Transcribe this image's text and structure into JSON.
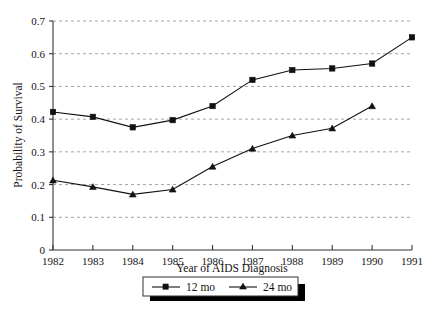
{
  "chart_data": {
    "type": "line",
    "title": "",
    "xlabel": "Year of AIDS Diagnosis",
    "ylabel": "Probability of Survival",
    "x": [
      1982,
      1983,
      1984,
      1985,
      1986,
      1987,
      1988,
      1989,
      1990,
      1991
    ],
    "xticklabels": [
      "1982",
      "1983",
      "1984",
      "1985",
      "1986",
      "1987",
      "1988",
      "1989",
      "1990",
      "1991"
    ],
    "yticklabels": [
      "0",
      "0.1",
      "0.2",
      "0.3",
      "0.4",
      "0.5",
      "0.6",
      "0.7"
    ],
    "yticks": [
      0,
      0.1,
      0.2,
      0.3,
      0.4,
      0.5,
      0.6,
      0.7
    ],
    "xlim": [
      1982,
      1991
    ],
    "ylim": [
      0,
      0.7
    ],
    "grid": "horizontal-dashed",
    "legend_position": "bottom-center",
    "series": [
      {
        "name": "12 mo",
        "marker": "square",
        "color": "#111111",
        "values": [
          0.422,
          0.407,
          0.375,
          0.397,
          0.44,
          0.52,
          0.55,
          0.555,
          0.57,
          0.65
        ]
      },
      {
        "name": "24 mo",
        "marker": "triangle",
        "color": "#111111",
        "values": [
          0.213,
          0.193,
          0.17,
          0.185,
          0.255,
          0.31,
          0.35,
          0.372,
          0.44,
          null
        ]
      }
    ]
  },
  "legend": {
    "items": [
      {
        "label": "12 mo",
        "marker": "square"
      },
      {
        "label": "24 mo",
        "marker": "triangle"
      }
    ]
  }
}
